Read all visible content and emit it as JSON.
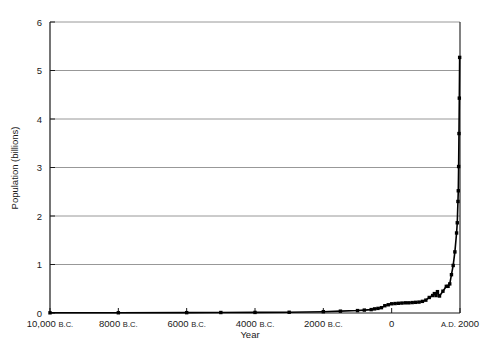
{
  "chart_data": {
    "type": "line",
    "title": "",
    "xlabel": "Year",
    "ylabel": "Population (billions)",
    "xlim": [
      -10000,
      2000
    ],
    "ylim": [
      0,
      6
    ],
    "grid": true,
    "legend": false,
    "legend_position": "none",
    "x_tick_values": [
      -10000,
      -8000,
      -6000,
      -4000,
      -2000,
      0,
      2000
    ],
    "x_tick_labels": [
      "10,000 B.C.",
      "8000 B.C.",
      "6000 B.C.",
      "4000 B.C.",
      "2000 B.C.",
      "0",
      "A.D. 2000"
    ],
    "y_tick_values": [
      0,
      1,
      2,
      3,
      4,
      5,
      6
    ],
    "y_tick_labels": [
      "0",
      "1",
      "2",
      "3",
      "4",
      "5",
      "6"
    ],
    "series": [
      {
        "name": "World population",
        "marker": "square",
        "x": [
          -10000,
          -8000,
          -6000,
          -5000,
          -4000,
          -3000,
          -2000,
          -1500,
          -1000,
          -800,
          -600,
          -500,
          -400,
          -300,
          -200,
          -100,
          0,
          100,
          200,
          300,
          400,
          500,
          600,
          700,
          800,
          900,
          1000,
          1100,
          1200,
          1250,
          1300,
          1340,
          1400,
          1500,
          1600,
          1650,
          1700,
          1750,
          1800,
          1850,
          1900,
          1920,
          1940,
          1950,
          1960,
          1970,
          1980,
          1990
        ],
        "y": [
          0.004,
          0.005,
          0.007,
          0.01,
          0.012,
          0.015,
          0.027,
          0.038,
          0.05,
          0.06,
          0.07,
          0.085,
          0.095,
          0.11,
          0.15,
          0.17,
          0.19,
          0.195,
          0.2,
          0.205,
          0.21,
          0.21,
          0.215,
          0.22,
          0.225,
          0.24,
          0.265,
          0.32,
          0.36,
          0.4,
          0.36,
          0.44,
          0.35,
          0.45,
          0.55,
          0.55,
          0.6,
          0.79,
          0.98,
          1.26,
          1.65,
          1.86,
          2.3,
          2.52,
          3.02,
          3.7,
          4.43,
          5.27
        ]
      }
    ]
  },
  "axis": {
    "y_label": "Population (billions)",
    "x_label": "Year"
  }
}
